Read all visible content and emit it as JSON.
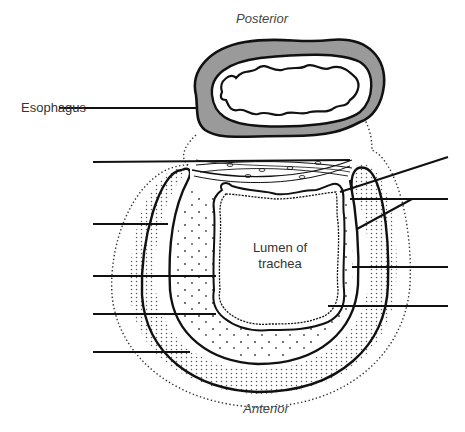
{
  "diagram": {
    "orientation": {
      "top": "Posterior",
      "bottom": "Anterior"
    },
    "labels": {
      "esophagus": "Esophagus",
      "lumen_line1": "Lumen of",
      "lumen_line2": "trachea"
    },
    "unlabeled_leader_lines": {
      "left_count": 5,
      "right_count": 4
    },
    "colors": {
      "stroke": "#111111",
      "esophagus_wall": "#9a9a9a",
      "dots": "#555555",
      "background": "#ffffff"
    }
  }
}
